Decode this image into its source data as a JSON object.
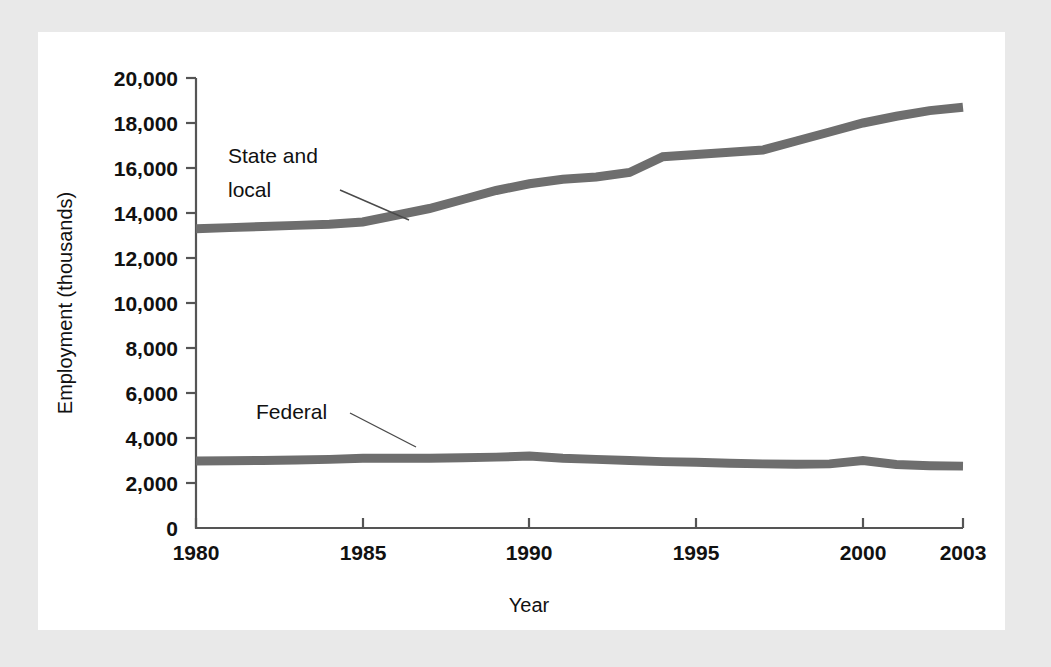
{
  "figure": {
    "background_color": "#e9e9e9",
    "card_color": "#ffffff",
    "line_color": "#6e6e6e",
    "axis_color": "#555555",
    "text_color": "#111111"
  },
  "chart_data": {
    "type": "line",
    "title": "",
    "xlabel": "Year",
    "ylabel": "Employment (thousands)",
    "xlim": [
      1980,
      2003
    ],
    "ylim": [
      0,
      20000
    ],
    "grid": false,
    "legend": "inline-annotations",
    "xticks": [
      "1980",
      "1985",
      "1990",
      "1995",
      "2000",
      "2003"
    ],
    "xtick_values": [
      1980,
      1985,
      1990,
      1995,
      2000,
      2003
    ],
    "yticks": [
      "0",
      "2,000",
      "4,000",
      "6,000",
      "8,000",
      "10,000",
      "12,000",
      "14,000",
      "16,000",
      "18,000",
      "20,000"
    ],
    "ytick_values": [
      0,
      2000,
      4000,
      6000,
      8000,
      10000,
      12000,
      14000,
      16000,
      18000,
      20000
    ],
    "x": [
      1980,
      1981,
      1982,
      1983,
      1984,
      1985,
      1986,
      1987,
      1988,
      1989,
      1990,
      1991,
      1992,
      1993,
      1994,
      1995,
      1996,
      1997,
      1998,
      1999,
      2000,
      2001,
      2002,
      2003
    ],
    "series": [
      {
        "name": "State and local",
        "label": "State and\nlocal",
        "label_line1": "State and",
        "label_line2": "local",
        "values": [
          13300,
          13350,
          13400,
          13450,
          13500,
          13600,
          13900,
          14200,
          14600,
          15000,
          15300,
          15500,
          15600,
          15800,
          16500,
          16600,
          16700,
          16800,
          17200,
          17600,
          18000,
          18300,
          18550,
          18700
        ]
      },
      {
        "name": "Federal",
        "label": "Federal",
        "values": [
          2980,
          2990,
          3000,
          3020,
          3050,
          3100,
          3100,
          3100,
          3120,
          3150,
          3200,
          3100,
          3050,
          3000,
          2950,
          2920,
          2880,
          2850,
          2830,
          2850,
          3000,
          2820,
          2770,
          2750
        ]
      }
    ],
    "annotations": [
      {
        "text_line1": "State and",
        "text_line2": "local",
        "points_to_year": 1985.6,
        "points_to_value": 13650
      },
      {
        "text": "Federal",
        "points_to_year": 1986.0,
        "points_to_value": 3100
      }
    ]
  }
}
